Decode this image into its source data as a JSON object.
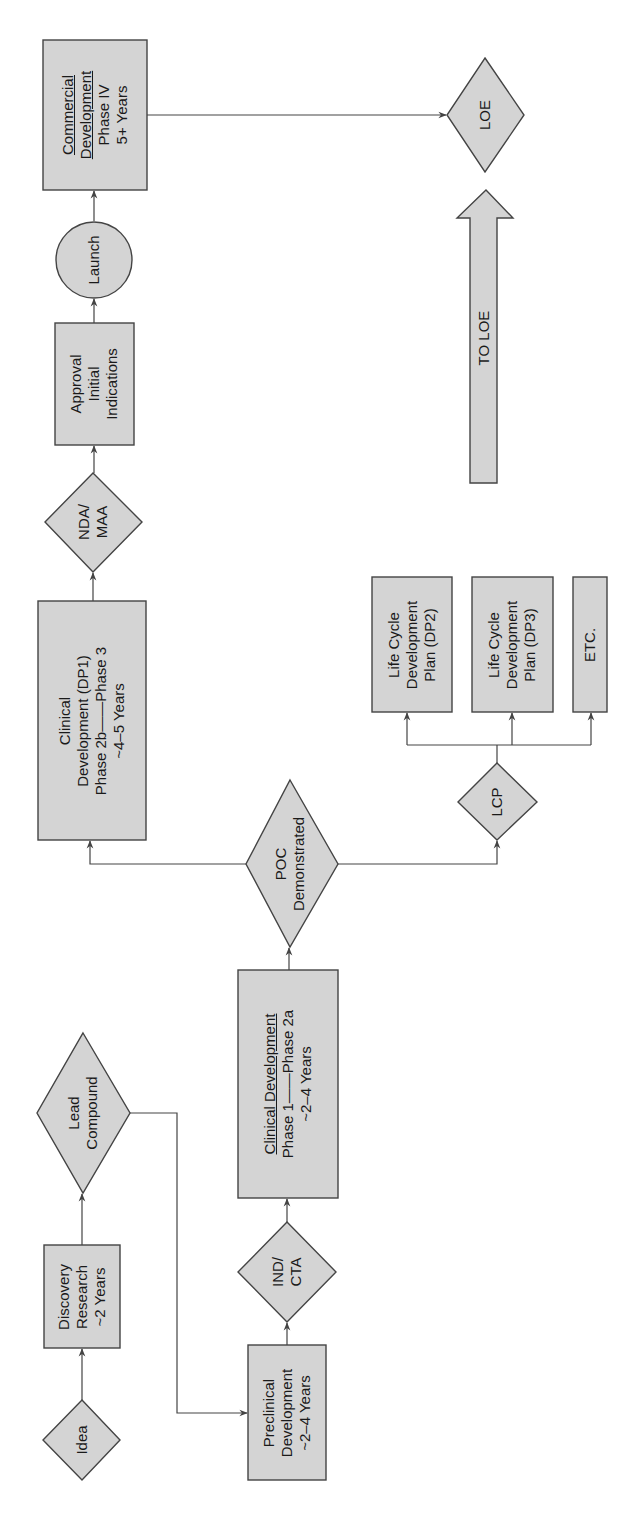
{
  "diagram": {
    "colors": {
      "fill": "#d4d4d4",
      "stroke": "#444444",
      "text": "#1a1a1a",
      "background": "#ffffff"
    },
    "nodes": {
      "idea": {
        "shape": "diamond",
        "lines": [
          "Idea"
        ]
      },
      "discovery": {
        "shape": "box",
        "lines": [
          "Discovery",
          "Research",
          "~2 Years"
        ]
      },
      "lead_compound": {
        "shape": "diamond",
        "lines": [
          "Lead",
          "Compound"
        ]
      },
      "preclinical": {
        "shape": "box",
        "lines": [
          "Preclinical",
          "Development",
          "~2–4 Years"
        ]
      },
      "ind_cta": {
        "shape": "diamond",
        "lines": [
          "IND/",
          "CTA"
        ]
      },
      "clinical_1_2a": {
        "shape": "box",
        "lines": [
          "Clinical Development",
          "Phase 1——Phase 2a",
          "~2–4 Years"
        ]
      },
      "poc": {
        "shape": "diamond",
        "lines": [
          "POC",
          "Demonstrated"
        ]
      },
      "clinical_dp1": {
        "shape": "box",
        "lines": [
          "Clinical",
          "Development (DP1)",
          "Phase 2b——Phase 3",
          "~4–5 Years"
        ]
      },
      "nda_maa": {
        "shape": "diamond",
        "lines": [
          "NDA/",
          "MAA"
        ]
      },
      "approval": {
        "shape": "box",
        "lines": [
          "Approval",
          "Initial",
          "Indications"
        ]
      },
      "launch": {
        "shape": "circle",
        "lines": [
          "Launch"
        ]
      },
      "commercial": {
        "shape": "box",
        "lines": [
          "Commercial",
          "Development",
          "Phase IV",
          "5+ Years"
        ]
      },
      "loe": {
        "shape": "diamond",
        "lines": [
          "LOE"
        ]
      },
      "to_loe": {
        "shape": "block-arrow",
        "lines": [
          "TO LOE"
        ]
      },
      "lcp": {
        "shape": "diamond",
        "lines": [
          "LCP"
        ]
      },
      "dp2": {
        "shape": "box",
        "lines": [
          "Life Cycle",
          "Development",
          "Plan (DP2)"
        ]
      },
      "dp3": {
        "shape": "box",
        "lines": [
          "Life Cycle",
          "Development",
          "Plan (DP3)"
        ]
      },
      "etc": {
        "shape": "box",
        "lines": [
          "ETC."
        ]
      }
    },
    "edges": [
      [
        "idea",
        "discovery"
      ],
      [
        "discovery",
        "lead_compound"
      ],
      [
        "lead_compound",
        "preclinical"
      ],
      [
        "preclinical",
        "ind_cta"
      ],
      [
        "ind_cta",
        "clinical_1_2a"
      ],
      [
        "clinical_1_2a",
        "poc"
      ],
      [
        "poc",
        "clinical_dp1"
      ],
      [
        "poc",
        "lcp"
      ],
      [
        "clinical_dp1",
        "nda_maa"
      ],
      [
        "nda_maa",
        "approval"
      ],
      [
        "approval",
        "launch"
      ],
      [
        "launch",
        "commercial"
      ],
      [
        "commercial",
        "loe"
      ],
      [
        "lcp",
        "dp2"
      ],
      [
        "lcp",
        "dp3"
      ],
      [
        "lcp",
        "etc"
      ]
    ]
  }
}
